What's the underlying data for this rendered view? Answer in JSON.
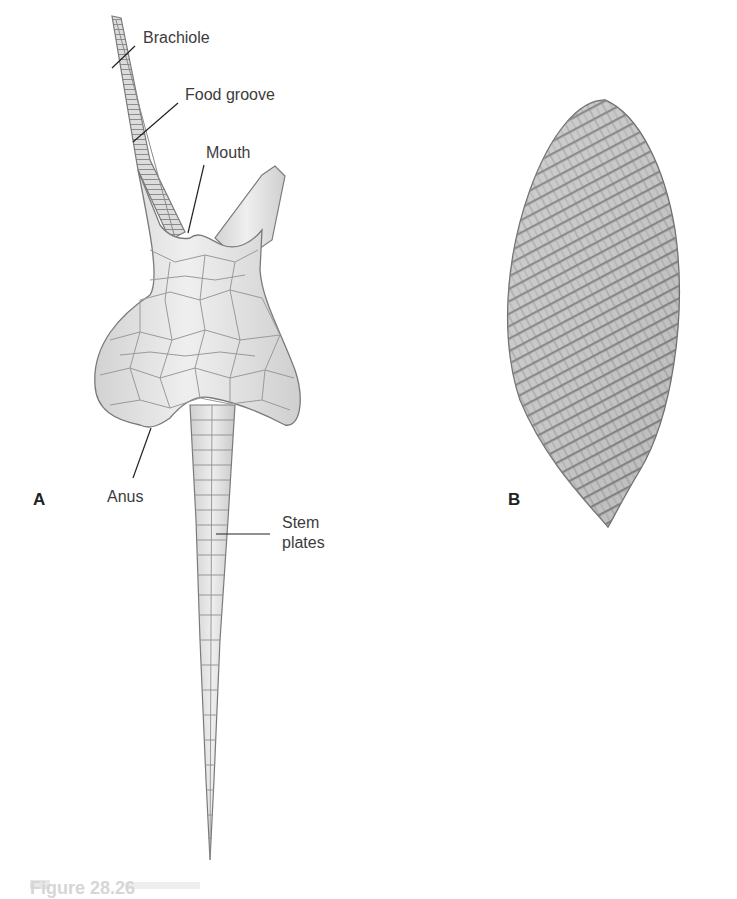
{
  "figure": {
    "panels": [
      {
        "id": "A",
        "letter": "A",
        "subject": "blastoid-like echinoderm with brachioles and stem",
        "labels": {
          "brachiole": "Brachiole",
          "food_groove": "Food groove",
          "mouth": "Mouth",
          "anus": "Anus",
          "stem_plates_line1": "Stem",
          "stem_plates_line2": "plates"
        }
      },
      {
        "id": "B",
        "letter": "B",
        "subject": "spirally plated ovoid echinoderm"
      }
    ],
    "caption_partial": "Figure 28.26"
  },
  "colors": {
    "background": "#ffffff",
    "plate_fill": "#e6e6e6",
    "plate_line": "#8a8a8a",
    "outline": "#7a7a7a",
    "leader_line": "#222222",
    "label_text": "#3c3c3c"
  }
}
